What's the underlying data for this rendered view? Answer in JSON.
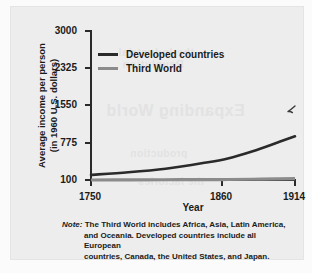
{
  "figure": {
    "background_color": "#ededed",
    "page_color": "#fbfbfb"
  },
  "axes": {
    "ytitle_line1": "Average income per person",
    "ytitle_line2": "(in 1960 U.S. dollars)",
    "xtitle": "Year",
    "yticks": [
      "3000",
      "2325",
      "1550",
      "775",
      "100"
    ],
    "xticks": [
      "1750",
      "1860",
      "1914"
    ]
  },
  "legend": {
    "entries": [
      {
        "label": "Developed countries",
        "color": "#2a2a2a"
      },
      {
        "label": "Third World",
        "color": "#8b8b8b"
      }
    ]
  },
  "note": {
    "label": "Note:",
    "line1": "The Third World includes Africa, Asia, Latin America,",
    "line2": "and Oceania. Developed countries include all European",
    "line3": "countries, Canada, the United States, and Japan."
  },
  "annotation": {
    "mark": "hand-drawn-check-mark"
  },
  "ghost_text": {
    "t1": "Expanding World",
    "t2": "the Industrial",
    "t3": "Revolution",
    "t4": "production",
    "t5": "the factories"
  },
  "chart_data": {
    "type": "line",
    "title": "",
    "subtitle": "",
    "xlabel": "Year",
    "ylabel": "Average income per person (in 1960 U.S. dollars)",
    "xlim": [
      1750,
      1914
    ],
    "ylim": [
      100,
      3000
    ],
    "xticks": [
      1750,
      1860,
      1914
    ],
    "yticks": [
      100,
      775,
      1550,
      2325,
      3000
    ],
    "grid": false,
    "legend_position": "upper-left-inside",
    "series": [
      {
        "name": "Developed countries",
        "color": "#2a2a2a",
        "x": [
          1750,
          1780,
          1810,
          1840,
          1860,
          1880,
          1900,
          1914
        ],
        "y": [
          200,
          250,
          320,
          430,
          520,
          660,
          830,
          950
        ]
      },
      {
        "name": "Third World",
        "color": "#8b8b8b",
        "x": [
          1750,
          1780,
          1810,
          1840,
          1860,
          1880,
          1900,
          1914
        ],
        "y": [
          100,
          102,
          105,
          108,
          110,
          115,
          120,
          125
        ]
      }
    ]
  }
}
